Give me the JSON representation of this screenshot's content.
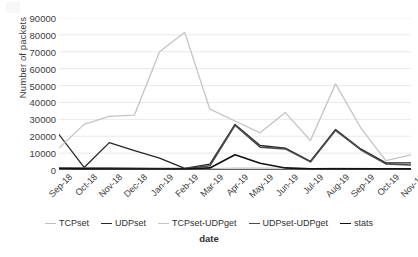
{
  "chart_data": {
    "type": "line",
    "title": "",
    "xlabel": "date",
    "ylabel": "Number of packets",
    "ylim": [
      0,
      90000
    ],
    "ytick_step": 10000,
    "yticks": [
      "0",
      "10000",
      "20000",
      "30000",
      "40000",
      "50000",
      "60000",
      "70000",
      "80000",
      "90000"
    ],
    "grid": true,
    "grid_axis": "y",
    "legend_position": "bottom",
    "categories": [
      "Sep-18",
      "Oct-18",
      "Nov-18",
      "Dec-18",
      "Jan-19",
      "Feb-19",
      "Mar-19",
      "Apr-19",
      "May-19",
      "Jun-19",
      "Jul-19",
      "Aug-19",
      "Sep-19",
      "Oct-19",
      "Nov-19"
    ],
    "series": [
      {
        "name": "TCPset",
        "color": "#bfbfbf",
        "width": 1.1,
        "values": [
          900,
          900,
          900,
          800,
          700,
          700,
          800,
          1200,
          1100,
          1000,
          900,
          1100,
          1000,
          900,
          900
        ]
      },
      {
        "name": "UDPset",
        "color": "#262626",
        "width": 1.3,
        "values": [
          21000,
          1500,
          16200,
          11500,
          7000,
          1000,
          3500,
          27000,
          14500,
          13000,
          5200,
          24000,
          12500,
          4200,
          4200
        ]
      },
      {
        "name": "TCPset-UDPget",
        "color": "#c4c4c4",
        "width": 1.3,
        "values": [
          13000,
          27000,
          31800,
          32500,
          70000,
          81500,
          36000,
          29000,
          22000,
          34000,
          17500,
          51000,
          25000,
          5500,
          9000
        ]
      },
      {
        "name": "UDPset-UDPget",
        "color": "#4a4a4a",
        "width": 1.6,
        "values": [
          1200,
          1200,
          1100,
          1000,
          900,
          900,
          2500,
          26500,
          13500,
          12500,
          4800,
          23500,
          12000,
          3600,
          3000
        ]
      },
      {
        "name": "stats",
        "color": "#111111",
        "width": 1.7,
        "values": [
          900,
          700,
          600,
          600,
          600,
          600,
          1200,
          9000,
          4000,
          1200,
          700,
          700,
          700,
          700,
          700
        ]
      }
    ]
  },
  "legend": {
    "items": [
      {
        "label": "TCPset"
      },
      {
        "label": "UDPset"
      },
      {
        "label": "TCPset-UDPget"
      },
      {
        "label": "UDPset-UDPget"
      },
      {
        "label": "stats"
      }
    ]
  },
  "axis": {
    "x_title": "date",
    "y_title": "Number of packets"
  }
}
